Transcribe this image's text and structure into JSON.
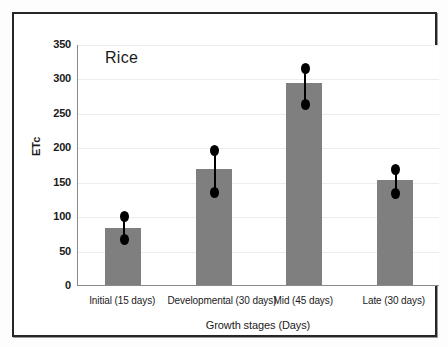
{
  "chart_data": {
    "type": "bar",
    "title": "Rice",
    "xlabel": "Growth stages (Days)",
    "ylabel": "ETc",
    "categories": [
      "Initial (15 days)",
      "Developmental (30 days)",
      "Mid (45 days)",
      "Late (30 days)"
    ],
    "values": [
      83,
      168,
      293,
      152
    ],
    "error_low": [
      68,
      137,
      265,
      135
    ],
    "error_high": [
      102,
      197,
      317,
      170
    ],
    "ylim": [
      0,
      350
    ],
    "yticks": [
      0,
      50,
      100,
      150,
      200,
      250,
      300,
      350
    ],
    "ytick_labels": [
      "0",
      "50",
      "100",
      "150",
      "200",
      "250",
      "300",
      "350"
    ],
    "grid": true,
    "legend": "none",
    "bar_color": "#7f7f7f",
    "error_color": "#000000",
    "grid_color": "#ededed",
    "axis_color": "#8a8a8a",
    "frame_color": "#262626"
  }
}
